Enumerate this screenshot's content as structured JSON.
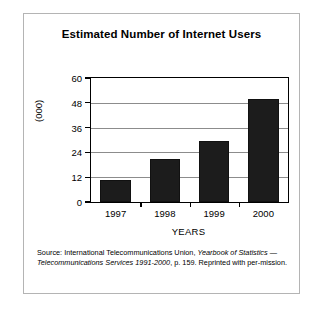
{
  "figure": {
    "title": "Estimated Number of Internet Users",
    "xaxis_title": "YEARS",
    "yaxis_title": "(000)",
    "source_line1_a": "Source: International Telecommunications Union, ",
    "source_line1_b": "Yearbook of Statistics",
    "source_line2_a": " — Telecommunications Services 1991-2000",
    "source_line2_b": ", p. 159. Reprinted with per-",
    "source_line3": "mission.",
    "border_color": "#b4b4b4",
    "bar_color": "#1c1c1c",
    "grid_color": "#8c8c8c",
    "axis_color": "#000000"
  },
  "chart_data": {
    "type": "bar",
    "title": "Estimated Number of Internet Users",
    "xlabel": "YEARS",
    "ylabel": "(000)",
    "categories": [
      "1997",
      "1998",
      "1999",
      "2000"
    ],
    "values": [
      10.5,
      21,
      29.5,
      50
    ],
    "ylim": [
      0,
      60
    ],
    "yticks": [
      0,
      12,
      24,
      36,
      48,
      60
    ],
    "ytick_labels": [
      "0",
      "12",
      "24",
      "36",
      "48",
      "60"
    ],
    "grid": true,
    "grid_axis": "y",
    "legend": false,
    "series": [
      {
        "name": "Estimated Number of Internet Users",
        "values": [
          10.5,
          21,
          29.5,
          50
        ]
      }
    ]
  }
}
